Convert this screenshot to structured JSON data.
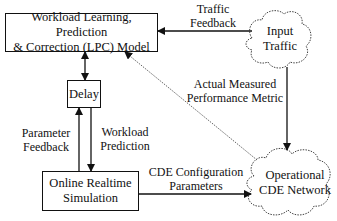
{
  "diagram": {
    "nodes": {
      "lpc_model": {
        "label_line1": "Workload Learning, Prediction",
        "label_line2": "& Correction (LPC) Model"
      },
      "delay": {
        "label": "Delay"
      },
      "simulation": {
        "label_line1": "Online Realtime",
        "label_line2": "Simulation"
      },
      "input_traffic": {
        "label_line1": "Input",
        "label_line2": "Traffic"
      },
      "cde_network": {
        "label_line1": "Operational",
        "label_line2": "CDE Network"
      }
    },
    "edges": {
      "traffic_feedback": {
        "label_line1": "Traffic",
        "label_line2": "Feedback",
        "from": "input_traffic",
        "to": "lpc_model"
      },
      "performance_metric": {
        "label_line1": "Actual Measured",
        "label_line2": "Performance Metric",
        "from": "cde_network",
        "to": "lpc_model",
        "style": "dotted"
      },
      "traffic_to_network": {
        "from": "input_traffic",
        "to": "cde_network"
      },
      "lpc_delay": {
        "from": "lpc_model",
        "to": "delay",
        "bidirectional": true
      },
      "parameter_feedback": {
        "label_line1": "Parameter",
        "label_line2": "Feedback",
        "from": "simulation",
        "to": "delay"
      },
      "workload_prediction": {
        "label_line1": "Workload",
        "label_line2": "Prediction",
        "from": "delay",
        "to": "simulation"
      },
      "cde_config": {
        "label_line1": "CDE Configuration",
        "label_line2": "Parameters",
        "from": "simulation",
        "to": "cde_network"
      }
    }
  }
}
